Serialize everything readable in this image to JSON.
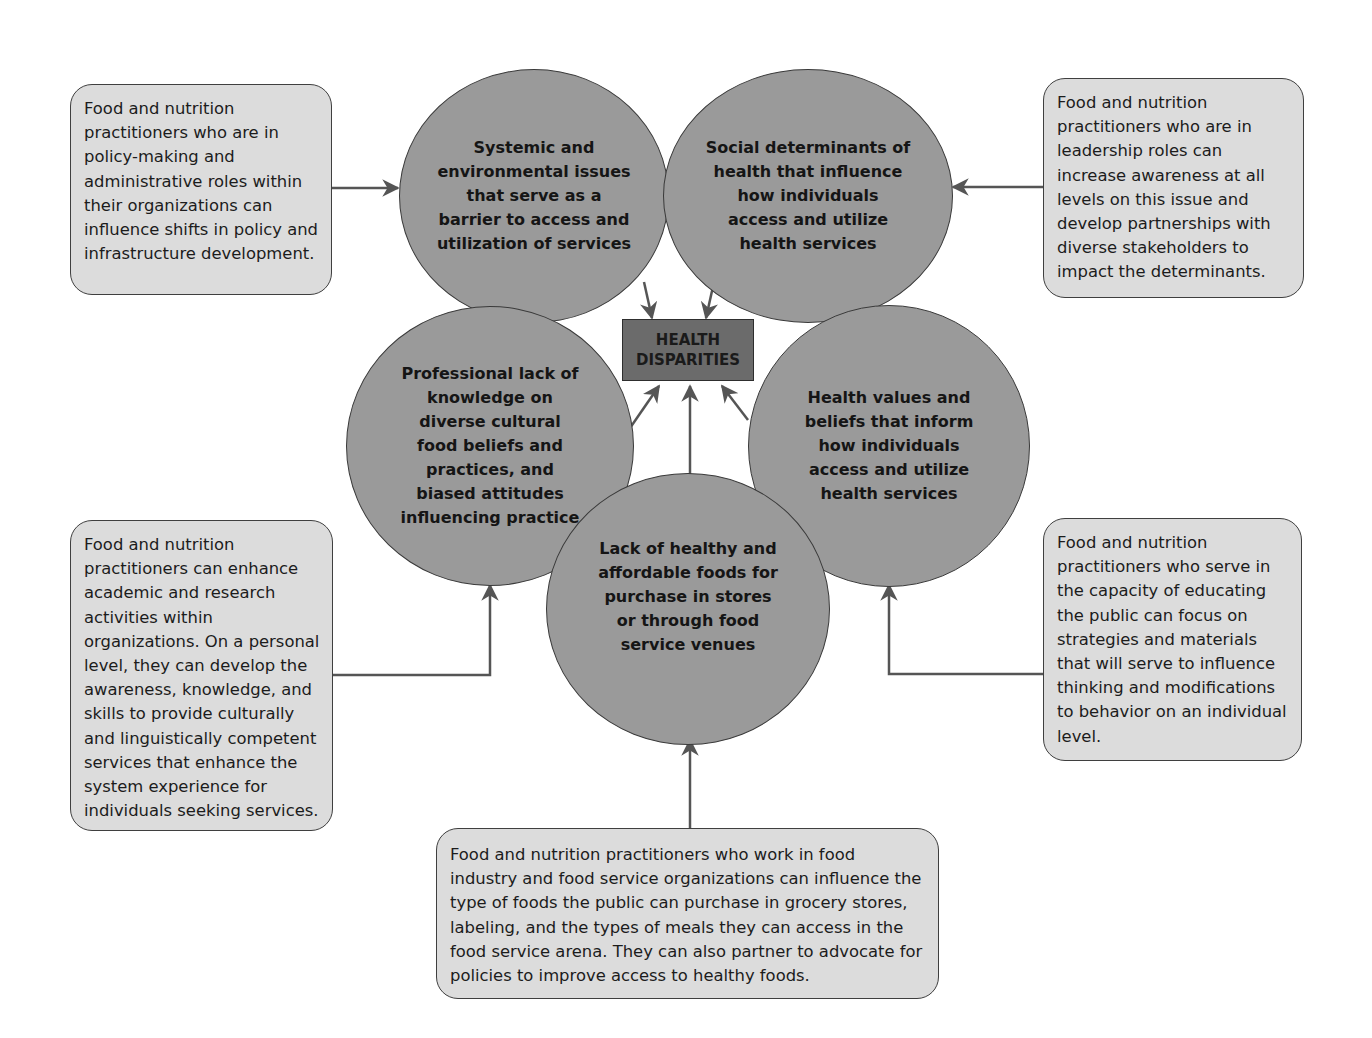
{
  "diagram": {
    "center": {
      "line1": "HEALTH",
      "line2": "DISPARITIES"
    },
    "factors": [
      {
        "id": "systemic",
        "text": "Systemic and environmental issues that serve as a barrier to access and utilization of services"
      },
      {
        "id": "social",
        "text": "Social determinants of health that influence how individuals access and utilize health services"
      },
      {
        "id": "professional",
        "text": "Professional lack of knowledge on diverse cultural food beliefs and practices, and biased attitudes influencing practice"
      },
      {
        "id": "values",
        "text": "Health values and beliefs that inform how individuals access and utilize health services"
      },
      {
        "id": "foods",
        "text": "Lack of healthy and affordable foods for purchase in stores or through food service venues"
      }
    ],
    "practitioner_roles": [
      {
        "id": "policy",
        "text": "Food and nutrition practitioners who are in policy-making and administrative roles within their organizations can influence shifts in policy and infrastructure development."
      },
      {
        "id": "leadership",
        "text": "Food and nutrition practitioners who are in leadership roles can increase awareness at all levels on this issue and develop partnerships with diverse stakeholders to impact the determinants."
      },
      {
        "id": "academic",
        "text": "Food and nutrition practitioners can enhance academic and research activities within organizations. On a personal level, they can develop the awareness, knowledge, and skills to provide culturally and linguistically competent services that enhance the system experience for individuals seeking services."
      },
      {
        "id": "educating",
        "text": "Food and nutrition practitioners who serve in the capacity of educating the public can focus on strategies and materials that will serve to influence thinking and modifications to behavior on an individual level."
      },
      {
        "id": "industry",
        "text": "Food and nutrition practitioners who work in food industry and food service organizations can influence the type of foods the public can purchase in grocery stores, labeling, and the types of meals they can access in the food service arena. They can also partner to advocate for policies to improve access to healthy foods."
      }
    ],
    "colors": {
      "circle_fill": "#9a9a9a",
      "box_fill": "#dcdcdc",
      "center_fill": "#6b6b6b",
      "arrow": "#555555"
    }
  }
}
